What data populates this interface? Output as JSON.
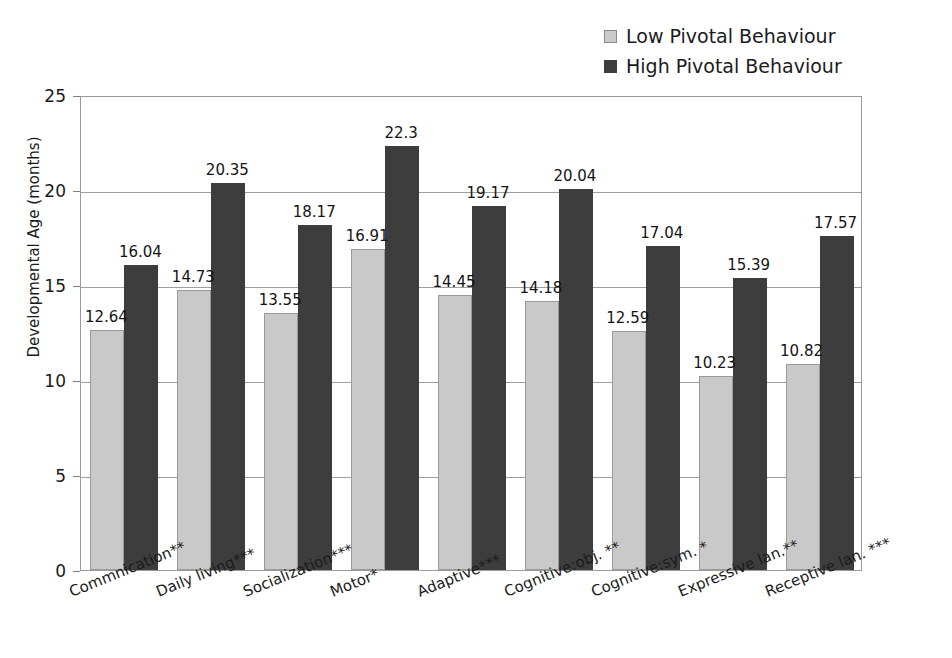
{
  "legend": {
    "position": "top-right",
    "items": [
      {
        "label": "Low Pivotal Behaviour",
        "color": "#c9c9c9",
        "swatch": "legend-swatch-low"
      },
      {
        "label": "High Pivotal Behaviour",
        "color": "#3d3d3d",
        "swatch": "legend-swatch-high"
      }
    ]
  },
  "axes": {
    "ylabel": "Developmental Age (months)",
    "xlabel": "",
    "yticks": [
      "0",
      "5",
      "10",
      "15",
      "20",
      "25"
    ],
    "ylim": [
      0,
      25
    ],
    "grid": true
  },
  "chart_data": {
    "type": "bar",
    "title": "",
    "xlabel": "",
    "ylabel": "Developmental Age (months)",
    "ylim": [
      0,
      25
    ],
    "yticks": [
      0,
      5,
      10,
      15,
      20,
      25
    ],
    "grid": true,
    "legend_position": "top-right",
    "categories": [
      "Commnication**",
      "Daily living***",
      "Socialization***",
      "Motor*",
      "Adaptive***",
      "Cognitive:obj. **",
      "Cognitive:sym. *",
      "Expressive lan.**",
      "Receptive lan. ***"
    ],
    "series": [
      {
        "name": "Low Pivotal Behaviour",
        "color": "#c9c9c9",
        "values": [
          12.64,
          14.73,
          13.55,
          16.91,
          14.45,
          14.18,
          12.59,
          10.23,
          10.82
        ],
        "labels": [
          "12.64",
          "14.73",
          "13.55",
          "16.91",
          "14.45",
          "14.18",
          "12.59",
          "10.23",
          "10.82"
        ]
      },
      {
        "name": "High Pivotal Behaviour",
        "color": "#3d3d3d",
        "values": [
          16.04,
          20.35,
          18.17,
          22.3,
          19.17,
          20.04,
          17.04,
          15.39,
          17.57
        ],
        "labels": [
          "16.04",
          "20.35",
          "18.17",
          "22.3",
          "19.17",
          "20.04",
          "17.04",
          "15.39",
          "17.57"
        ]
      }
    ]
  }
}
